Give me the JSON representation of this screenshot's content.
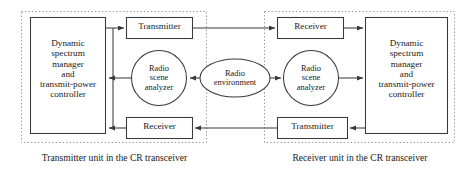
{
  "figure": {
    "type": "block-diagram",
    "title": "",
    "background_color": "#ffffff",
    "line_color": "#3a3a3a",
    "text_color": "#1a1a1a",
    "dashed_border_color": "#9a9a9a"
  },
  "left_unit": {
    "caption": "Transmitter unit in the CR transceiver",
    "controller": {
      "label": "Dynamic\nspectrum\nmanager\nand\ntransmit-power\ncontroller"
    },
    "transmitter": {
      "label": "Transmitter"
    },
    "receiver": {
      "label": "Receiver"
    },
    "analyzer": {
      "label": "Radio\nscene\nanalyzer"
    }
  },
  "right_unit": {
    "caption": "Receiver unit in the CR transceiver",
    "controller": {
      "label": "Dynamic\nspectrum\nmanager\nand\ntransmit-power\ncontroller"
    },
    "receiver": {
      "label": "Receiver"
    },
    "transmitter": {
      "label": "Transmitter"
    },
    "analyzer": {
      "label": "Radio\nscene\nanalyzer"
    }
  },
  "center": {
    "environment": {
      "label": "Radio\nenvironment"
    }
  },
  "connections": [
    {
      "name": "left-controller-to-transmitter",
      "from": "left_unit.controller",
      "to": "left_unit.transmitter",
      "direction": "right"
    },
    {
      "name": "left-transmitter-to-right-receiver",
      "from": "left_unit.transmitter",
      "to": "right_unit.receiver",
      "direction": "right"
    },
    {
      "name": "left-analyzer-to-controller",
      "from": "left_unit.analyzer",
      "to": "left_unit.controller",
      "direction": "left"
    },
    {
      "name": "environment-to-left-analyzer",
      "from": "center.environment",
      "to": "left_unit.analyzer",
      "direction": "left"
    },
    {
      "name": "environment-to-right-analyzer",
      "from": "center.environment",
      "to": "right_unit.analyzer",
      "direction": "right"
    },
    {
      "name": "right-analyzer-to-controller",
      "from": "right_unit.analyzer",
      "to": "right_unit.controller",
      "direction": "right"
    },
    {
      "name": "right-receiver-to-controller",
      "from": "right_unit.receiver",
      "to": "right_unit.controller",
      "direction": "right"
    },
    {
      "name": "right-controller-to-transmitter",
      "from": "right_unit.controller",
      "to": "right_unit.transmitter",
      "direction": "left"
    },
    {
      "name": "right-transmitter-to-left-receiver",
      "from": "right_unit.transmitter",
      "to": "left_unit.receiver",
      "direction": "left"
    },
    {
      "name": "left-receiver-to-controller",
      "from": "left_unit.receiver",
      "to": "left_unit.controller",
      "direction": "left"
    }
  ]
}
